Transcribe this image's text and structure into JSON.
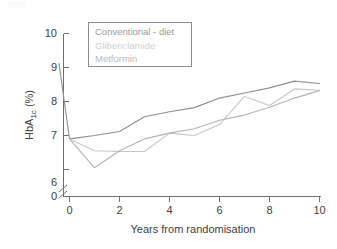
{
  "chart_data": {
    "type": "line",
    "title": "",
    "xlabel": "Years from randomisation",
    "ylabel": "HbA1c (%)",
    "ylabel_base": "HbA",
    "ylabel_sub": "1c",
    "ylabel_unit": " (%)",
    "xlim": [
      -0.6,
      10
    ],
    "ylim": [
      5.85,
      10
    ],
    "y_axis_break": true,
    "y_zero_label": "0",
    "grid": false,
    "legend_position": "top-left-inside",
    "x_ticks": [
      0,
      2,
      4,
      6,
      8,
      10
    ],
    "x_tick_labels": [
      "0",
      "2",
      "4",
      "6",
      "8",
      "10"
    ],
    "y_ticks": [
      6,
      7,
      8,
      9,
      10
    ],
    "y_tick_labels": [
      "6",
      "7",
      "8",
      "9",
      "10"
    ],
    "series": [
      {
        "name": "Conventional - diet",
        "color": "#8f8f8f",
        "x": [
          -0.42,
          0,
          1,
          2,
          3,
          4,
          5,
          6,
          7,
          8,
          9,
          10
        ],
        "values": [
          9.12,
          6.9,
          7.0,
          7.12,
          7.55,
          7.7,
          7.82,
          8.1,
          8.25,
          8.4,
          8.6,
          8.53
        ]
      },
      {
        "name": "Glibenclamide",
        "color": "#c6c6c6",
        "x": [
          0,
          1,
          2,
          3,
          4,
          5,
          6,
          7,
          8,
          9,
          10
        ],
        "values": [
          6.9,
          6.55,
          6.53,
          6.53,
          7.07,
          7.0,
          7.32,
          8.15,
          7.88,
          8.37,
          8.33
        ]
      },
      {
        "name": "Metformin",
        "color": "#b4b4b4",
        "x": [
          0,
          1,
          2,
          3,
          4,
          5,
          6,
          7,
          8,
          9,
          10
        ],
        "values": [
          6.9,
          6.05,
          6.55,
          6.9,
          7.07,
          7.2,
          7.45,
          7.6,
          7.83,
          8.1,
          8.32
        ]
      }
    ],
    "legend_entries": [
      {
        "label": "Conventional - diet",
        "color": "#8f8f8f"
      },
      {
        "label": "Glibenclamide",
        "color": "#c6c6c6"
      },
      {
        "label": "Metformin",
        "color": "#b4b4b4"
      }
    ]
  }
}
